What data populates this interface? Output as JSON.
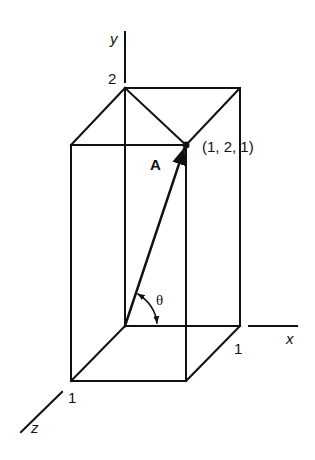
{
  "diagram": {
    "type": "3d-vector-box",
    "axes": {
      "x": {
        "label": "x"
      },
      "y": {
        "label": "y"
      },
      "z": {
        "label": "z"
      }
    },
    "tick_labels": {
      "y_top": "2",
      "x_end": "1",
      "z_end": "1"
    },
    "vector": {
      "label": "A",
      "point_label": "(1, 2, 1)"
    },
    "angle": {
      "label": "θ"
    },
    "colors": {
      "stroke": "#111111",
      "background": "#ffffff"
    }
  }
}
